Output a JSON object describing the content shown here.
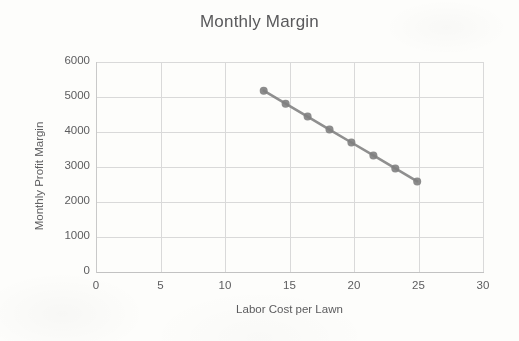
{
  "chart_data": {
    "type": "line",
    "title": "Monthly Margin",
    "xlabel": "Labor Cost per Lawn",
    "ylabel": "Monthly Profit Margin",
    "xlim": [
      0,
      30
    ],
    "ylim": [
      0,
      6000
    ],
    "xticks": [
      0,
      5,
      10,
      15,
      20,
      25,
      30
    ],
    "yticks": [
      0,
      1000,
      2000,
      3000,
      4000,
      5000,
      6000
    ],
    "xtick_labels": [
      "0",
      "5",
      "10",
      "15",
      "20",
      "25",
      "30"
    ],
    "ytick_labels": [
      "0",
      "1000",
      "2000",
      "3000",
      "4000",
      "5000",
      "6000"
    ],
    "grid": true,
    "legend": null,
    "series": [
      {
        "name": "Monthly Profit Margin",
        "color": "#808080",
        "marker": "circle",
        "x": [
          13.0,
          14.7,
          16.4,
          18.1,
          19.8,
          21.5,
          23.2,
          24.9
        ],
        "values": [
          5180,
          4810,
          4440,
          4070,
          3700,
          3330,
          2960,
          2590
        ]
      }
    ]
  }
}
